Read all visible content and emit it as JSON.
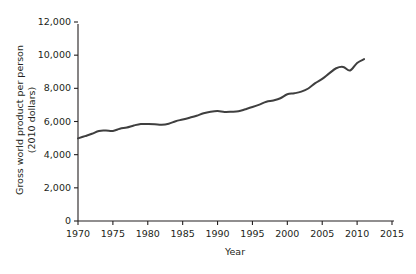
{
  "chart_data": {
    "type": "line",
    "title": "",
    "xlabel": "Year",
    "ylabel": "Gross world product per person\n(2010 dollars)",
    "ylabel_line1": "Gross world product per person",
    "ylabel_line2": "(2010 dollars)",
    "xlim": [
      1970,
      2015
    ],
    "ylim": [
      0,
      12000
    ],
    "xticks": [
      1970,
      1975,
      1980,
      1985,
      1990,
      1995,
      2000,
      2005,
      2010,
      2015
    ],
    "xtick_labels": [
      "1970",
      "1975",
      "1980",
      "1985",
      "1990",
      "1995",
      "2000",
      "2005",
      "2010",
      "2015"
    ],
    "yticks": [
      0,
      2000,
      4000,
      6000,
      8000,
      10000,
      12000
    ],
    "ytick_labels": [
      "0",
      "2,000",
      "4,000",
      "6,000",
      "8,000",
      "10,000",
      "12,000"
    ],
    "grid": false,
    "legend": null,
    "line_color": "#3f3f3f",
    "line_width": 2.0,
    "series": [
      {
        "name": "Gross world product per person",
        "x": [
          1970,
          1971,
          1972,
          1973,
          1974,
          1975,
          1976,
          1977,
          1978,
          1979,
          1980,
          1981,
          1982,
          1983,
          1984,
          1985,
          1986,
          1987,
          1988,
          1989,
          1990,
          1991,
          1992,
          1993,
          1994,
          1995,
          1996,
          1997,
          1998,
          1999,
          2000,
          2001,
          2002,
          2003,
          2004,
          2005,
          2006,
          2007,
          2008,
          2009,
          2010,
          2011
        ],
        "y": [
          4985,
          5120,
          5260,
          5430,
          5450,
          5430,
          5560,
          5640,
          5760,
          5850,
          5850,
          5840,
          5810,
          5870,
          6020,
          6120,
          6230,
          6350,
          6500,
          6590,
          6630,
          6580,
          6590,
          6620,
          6740,
          6870,
          7020,
          7190,
          7270,
          7400,
          7640,
          7700,
          7800,
          7990,
          8310,
          8570,
          8900,
          9210,
          9290,
          9080,
          9530,
          9760
        ]
      }
    ],
    "annotations": []
  },
  "axis": {
    "color": "#231f20",
    "tick_len": 4
  }
}
